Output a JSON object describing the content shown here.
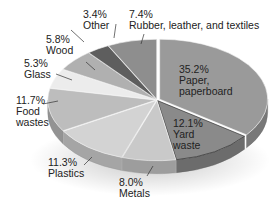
{
  "chart_data": {
    "type": "pie",
    "style": "3d-exploded-ellipse",
    "title": "",
    "slices": [
      {
        "name": "Paper, paperboard",
        "value": 35.2,
        "label": "35.2%",
        "line1": "Paper,",
        "line2": "paperboard",
        "color": "#9a9a9a"
      },
      {
        "name": "Yard waste",
        "value": 12.1,
        "label": "12.1%",
        "line1": "Yard",
        "line2": "waste",
        "color": "#8a8a8a"
      },
      {
        "name": "Metals",
        "value": 8.0,
        "label": "8.0%",
        "line1": "Metals",
        "line2": "",
        "color": "#c9c9c9"
      },
      {
        "name": "Plastics",
        "value": 11.3,
        "label": "11.3%",
        "line1": "Plastics",
        "line2": "",
        "color": "#d3d3d3"
      },
      {
        "name": "Food wastes",
        "value": 11.7,
        "label": "11.7%",
        "line1": "Food",
        "line2": "wastes",
        "color": "#bdbdbd"
      },
      {
        "name": "Glass",
        "value": 5.3,
        "label": "5.3%",
        "line1": "Glass",
        "line2": "",
        "color": "#ececec"
      },
      {
        "name": "Wood",
        "value": 5.8,
        "label": "5.8%",
        "line1": "Wood",
        "line2": "",
        "color": "#b0b0b0"
      },
      {
        "name": "Other",
        "value": 3.4,
        "label": "3.4%",
        "line1": "Other",
        "line2": "",
        "color": "#5e5e5e"
      },
      {
        "name": "Rubber, leather, and textiles",
        "value": 7.4,
        "label": "7.4%",
        "line1": "Rubber, leather, and textiles",
        "line2": "",
        "color": "#8e8e8e"
      }
    ],
    "unit": "%",
    "legend": "none (direct labels)"
  },
  "labels": {
    "paper": {
      "pct": "35.2%",
      "l1": "Paper,",
      "l2": "paperboard"
    },
    "yard": {
      "pct": "12.1%",
      "l1": "Yard",
      "l2": "waste"
    },
    "metals": {
      "pct": "8.0%",
      "l1": "Metals"
    },
    "plastics": {
      "pct": "11.3%",
      "l1": "Plastics"
    },
    "food": {
      "pct": "11.7%",
      "l1": "Food",
      "l2": "wastes"
    },
    "glass": {
      "pct": "5.3%",
      "l1": "Glass"
    },
    "wood": {
      "pct": "5.8%",
      "l1": "Wood"
    },
    "other": {
      "pct": "3.4%",
      "l1": "Other"
    },
    "rubber": {
      "pct": "7.4%",
      "l1": "Rubber, leather, and textiles"
    }
  }
}
